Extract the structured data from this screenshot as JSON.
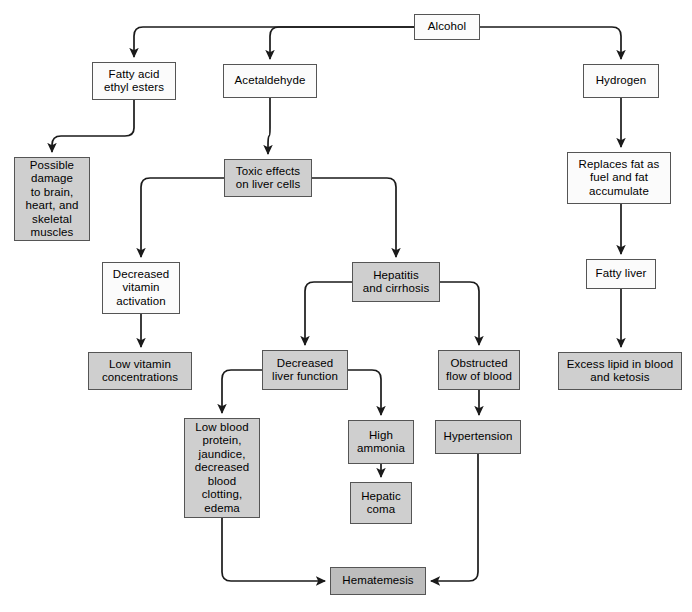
{
  "diagram": {
    "colors": {
      "box_fill_white": "#fbfbfb",
      "box_fill_gray": "#cfcfcf",
      "box_fill_dark": "#bdbdbd",
      "box_border": "#555555",
      "connector": "#1a1a1a",
      "background": "#ffffff"
    },
    "nodes": [
      {
        "id": "alcohol",
        "label": "Alcohol",
        "fill": "white",
        "x": 414,
        "y": 14,
        "w": 66,
        "h": 26
      },
      {
        "id": "fatty-acid",
        "label": "Fatty acid\nethyl esters",
        "fill": "white",
        "x": 92,
        "y": 62,
        "w": 84,
        "h": 38
      },
      {
        "id": "acetaldehyde",
        "label": "Acetaldehyde",
        "fill": "white",
        "x": 223,
        "y": 64,
        "w": 94,
        "h": 34
      },
      {
        "id": "hydrogen",
        "label": "Hydrogen",
        "fill": "white",
        "x": 583,
        "y": 64,
        "w": 76,
        "h": 34
      },
      {
        "id": "possible-damage",
        "label": "Possible\ndamage\nto brain,\nheart, and\nskeletal\nmuscles",
        "fill": "gray",
        "x": 14,
        "y": 157,
        "w": 76,
        "h": 84
      },
      {
        "id": "toxic-effects",
        "label": "Toxic effects\non liver cells",
        "fill": "gray",
        "x": 224,
        "y": 159,
        "w": 88,
        "h": 38
      },
      {
        "id": "replaces-fat",
        "label": "Replaces fat as\nfuel and fat\naccumulate",
        "fill": "white",
        "x": 567,
        "y": 152,
        "w": 104,
        "h": 52
      },
      {
        "id": "decreased-vit",
        "label": "Decreased\nvitamin\nactivation",
        "fill": "white",
        "x": 102,
        "y": 262,
        "w": 78,
        "h": 52
      },
      {
        "id": "hepatitis",
        "label": "Hepatitis\nand cirrhosis",
        "fill": "gray",
        "x": 352,
        "y": 262,
        "w": 88,
        "h": 40
      },
      {
        "id": "fatty-liver",
        "label": "Fatty liver",
        "fill": "white",
        "x": 586,
        "y": 259,
        "w": 70,
        "h": 30
      },
      {
        "id": "low-vitamin",
        "label": "Low vitamin\nconcentrations",
        "fill": "gray",
        "x": 88,
        "y": 352,
        "w": 104,
        "h": 38
      },
      {
        "id": "decreased-liver",
        "label": "Decreased\nliver function",
        "fill": "gray",
        "x": 262,
        "y": 350,
        "w": 86,
        "h": 40
      },
      {
        "id": "obstructed-flow",
        "label": "Obstructed\nflow of blood",
        "fill": "gray",
        "x": 438,
        "y": 350,
        "w": 82,
        "h": 40
      },
      {
        "id": "excess-lipid",
        "label": "Excess lipid in blood\nand ketosis",
        "fill": "gray",
        "x": 558,
        "y": 352,
        "w": 124,
        "h": 38
      },
      {
        "id": "low-blood",
        "label": "Low blood\nprotein,\njaundice,\ndecreased\nblood\nclotting,\nedema",
        "fill": "gray",
        "x": 184,
        "y": 418,
        "w": 76,
        "h": 100
      },
      {
        "id": "high-ammonia",
        "label": "High\nammonia",
        "fill": "gray",
        "x": 348,
        "y": 420,
        "w": 66,
        "h": 44
      },
      {
        "id": "hypertension",
        "label": "Hypertension",
        "fill": "gray",
        "x": 435,
        "y": 420,
        "w": 86,
        "h": 34
      },
      {
        "id": "hepatic-coma",
        "label": "Hepatic\ncoma",
        "fill": "gray",
        "x": 350,
        "y": 482,
        "w": 62,
        "h": 42
      },
      {
        "id": "hematemesis",
        "label": "Hematemesis",
        "fill": "dark",
        "x": 330,
        "y": 567,
        "w": 96,
        "h": 28
      }
    ],
    "connectors": [
      {
        "id": "alcohol-to-fatty-acid",
        "from": "alcohol",
        "to": "fatty-acid"
      },
      {
        "id": "alcohol-to-acetaldehyde",
        "from": "alcohol",
        "to": "acetaldehyde"
      },
      {
        "id": "alcohol-to-hydrogen",
        "from": "alcohol",
        "to": "hydrogen"
      },
      {
        "id": "fatty-acid-to-possible-damage",
        "from": "fatty-acid",
        "to": "possible-damage"
      },
      {
        "id": "acetaldehyde-to-toxic",
        "from": "acetaldehyde",
        "to": "toxic-effects"
      },
      {
        "id": "toxic-to-decreased-vit",
        "from": "toxic-effects",
        "to": "decreased-vit"
      },
      {
        "id": "toxic-to-hepatitis",
        "from": "toxic-effects",
        "to": "hepatitis"
      },
      {
        "id": "decreased-vit-to-low-vitamin",
        "from": "decreased-vit",
        "to": "low-vitamin"
      },
      {
        "id": "hepatitis-to-decreased-liver",
        "from": "hepatitis",
        "to": "decreased-liver"
      },
      {
        "id": "hepatitis-to-obstructed",
        "from": "hepatitis",
        "to": "obstructed-flow"
      },
      {
        "id": "decreased-liver-to-low-blood",
        "from": "decreased-liver",
        "to": "low-blood"
      },
      {
        "id": "decreased-liver-to-ammonia",
        "from": "decreased-liver",
        "to": "high-ammonia"
      },
      {
        "id": "ammonia-to-hepatic-coma",
        "from": "high-ammonia",
        "to": "hepatic-coma"
      },
      {
        "id": "low-blood-to-hematemesis",
        "from": "low-blood",
        "to": "hematemesis"
      },
      {
        "id": "obstructed-to-hypertension",
        "from": "obstructed-flow",
        "to": "hypertension"
      },
      {
        "id": "hypertension-to-hematemesis",
        "from": "hypertension",
        "to": "hematemesis"
      },
      {
        "id": "hydrogen-to-replaces-fat",
        "from": "hydrogen",
        "to": "replaces-fat"
      },
      {
        "id": "replaces-fat-to-fatty-liver",
        "from": "replaces-fat",
        "to": "fatty-liver"
      },
      {
        "id": "fatty-liver-to-excess-lipid",
        "from": "fatty-liver",
        "to": "excess-lipid"
      }
    ]
  }
}
